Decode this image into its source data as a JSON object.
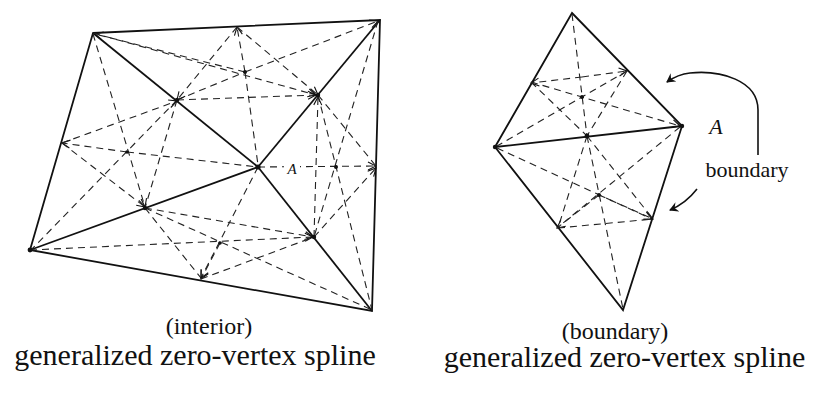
{
  "figures": [
    {
      "id": "interior",
      "subtitle": "(interior)",
      "title": "generalized zero-vertex spline",
      "point_label": "A"
    },
    {
      "id": "boundary",
      "subtitle": "(boundary)",
      "title": "generalized zero-vertex spline",
      "point_label": "A",
      "annotation": "boundary"
    }
  ]
}
